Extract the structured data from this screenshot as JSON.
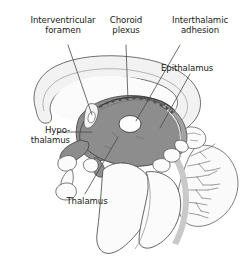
{
  "figure": {
    "type": "anatomical-illustration",
    "background_color": "#ffffff",
    "palette": {
      "outline": "#555555",
      "thalamus_fill": "#8d8d8d",
      "midbrain_fill": "#9a9a9a",
      "corpus_callosum_fill": "#f2f2f2",
      "ventricle_fill": "#fbfbfb",
      "cerebellum_fill": "#fafafa",
      "leader_line": "#4a4a4a",
      "text": "#1a1a1a"
    }
  },
  "labels": [
    {
      "id": "interventricular-foramen",
      "text": "Interventricular\nforamen",
      "align": "center",
      "leader": "diagonal down-right to the interventricular foramen at the anterior thalamus"
    },
    {
      "id": "choroid-plexus",
      "text": "Choroid\nplexus",
      "align": "center",
      "leader": "vertical down to the serrated choroid plexus along the roof of the third ventricle"
    },
    {
      "id": "interthalamic-adhesion",
      "text": "Interthalamic\nadhesion",
      "align": "center",
      "leader": "diagonal down-left to the white oval in the center of the thalamus"
    },
    {
      "id": "epithalamus",
      "text": "Epithalamus",
      "align": "left",
      "leader": "diagonal down-left to the posterior epithalamus / pineal region"
    },
    {
      "id": "hypothalamus",
      "text": "Hypo-\nthalamus",
      "align": "right",
      "leader": "horizontal right to the antero-inferior hypothalamic region"
    },
    {
      "id": "thalamus",
      "text": "Thalamus",
      "align": "center",
      "leader": "diagonal up-right into the shaded thalamic body"
    }
  ],
  "structures": [
    {
      "id": "corpus-callosum",
      "name": "Corpus callosum",
      "fill": "#f2f2f2"
    },
    {
      "id": "lateral-ventricle",
      "name": "Lateral ventricle",
      "fill": "#fbfbfb"
    },
    {
      "id": "thalamus-body",
      "name": "Thalamus",
      "fill": "#8d8d8d"
    },
    {
      "id": "interthalamic-adhesion-oval",
      "name": "Interthalamic adhesion",
      "fill": "#fdfdfd"
    },
    {
      "id": "choroid-plexus-band",
      "name": "Choroid plexus",
      "fill": "#6f6f6f"
    },
    {
      "id": "hypothalamus-region",
      "name": "Hypothalamus",
      "fill": "#8d8d8d"
    },
    {
      "id": "brainstem",
      "name": "Brainstem",
      "fill": "#fbfbfb"
    },
    {
      "id": "cerebellum",
      "name": "Cerebellum (arbor vitae)",
      "fill": "#fafafa"
    },
    {
      "id": "pituitary",
      "name": "Pituitary / infundibulum",
      "fill": "#fbfbfb"
    }
  ]
}
